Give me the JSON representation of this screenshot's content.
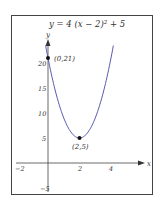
{
  "chart_data": {
    "type": "line",
    "equation": "y = 4(x-2)^2 + 5",
    "xlabel": "x",
    "ylabel": "y",
    "xlim": [
      -2,
      4.6
    ],
    "ylim": [
      -5,
      25
    ],
    "x_ticks": [
      "-2",
      "2",
      "4"
    ],
    "y_ticks": [
      "5",
      "10",
      "15",
      "20",
      "-5"
    ],
    "grid": false,
    "legend": null,
    "series": [
      {
        "name": "y = 4(x-2)^2 + 5",
        "x": [
          -0.1,
          0,
          0.5,
          1,
          1.5,
          2,
          2.5,
          3,
          3.5,
          4,
          4.1
        ],
        "y": [
          22.64,
          21,
          14,
          9,
          6,
          5,
          6,
          9,
          14,
          21,
          22.64
        ]
      }
    ],
    "annotations": [
      {
        "label": "(0,21)",
        "x": 0,
        "y": 21
      },
      {
        "label": "(2,5)",
        "x": 2,
        "y": 5
      }
    ],
    "colors": {
      "curve": "#5a5ab0",
      "axis": "#333333",
      "frame": "#444444",
      "point": "#111111"
    }
  },
  "labels": {
    "title_prefix": "y = 4 (x − 2)",
    "title_exp": "2",
    "title_suffix": " + 5",
    "x_axis": "x",
    "y_axis": "y",
    "tick_x_neg2": "−2",
    "tick_x_2": "2",
    "tick_x_4": "4",
    "tick_y_5": "5",
    "tick_y_10": "10",
    "tick_y_15": "15",
    "tick_y_20": "20",
    "tick_y_neg5": "−5",
    "point_intercept": "(0,21)",
    "point_vertex": "(2,5)"
  }
}
